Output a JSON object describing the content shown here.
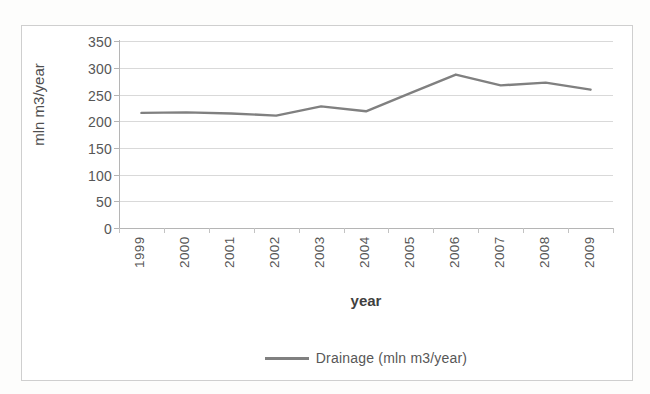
{
  "chart_data": {
    "type": "line",
    "title": "",
    "xlabel": "year",
    "ylabel": "mln m3/year",
    "categories": [
      "1999",
      "2000",
      "2001",
      "2002",
      "2003",
      "2004",
      "2005",
      "2006",
      "2007",
      "2008",
      "2009"
    ],
    "series": [
      {
        "name": "Drainage (mln m3/year)",
        "values": [
          215,
          216,
          214,
          210,
          227,
          218,
          252,
          286,
          266,
          271,
          258
        ],
        "color": "#808080"
      }
    ],
    "ylim": [
      0,
      350
    ],
    "yticks": [
      0,
      50,
      100,
      150,
      200,
      250,
      300,
      350
    ],
    "ytick_labels": [
      "0",
      "50",
      "100",
      "150",
      "200",
      "250",
      "300",
      "350"
    ],
    "grid": true,
    "legend_position": "bottom"
  },
  "legend": {
    "entries": [
      {
        "label": "Drainage (mln m3/year)",
        "color": "#808080"
      }
    ]
  },
  "colors": {
    "series_line": "#808080",
    "gridline": "#d9d9d9",
    "axis": "#b5b5b5",
    "frame_border": "#cfcfcf",
    "text": "#565656"
  }
}
